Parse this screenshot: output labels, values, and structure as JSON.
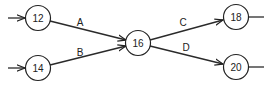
{
  "diagram": {
    "type": "activity-network",
    "colors": {
      "stroke": "#222222",
      "background": "#ffffff"
    },
    "nodes": [
      {
        "id": "12",
        "label": "12",
        "x": 38,
        "y": 18
      },
      {
        "id": "14",
        "label": "14",
        "x": 38,
        "y": 68
      },
      {
        "id": "16",
        "label": "16",
        "x": 138,
        "y": 43
      },
      {
        "id": "18",
        "label": "18",
        "x": 236,
        "y": 17
      },
      {
        "id": "20",
        "label": "20",
        "x": 236,
        "y": 67
      }
    ],
    "edges": [
      {
        "label": "A",
        "from": "12",
        "to": "16",
        "label_x": 80,
        "label_y": 22
      },
      {
        "label": "B",
        "from": "14",
        "to": "16",
        "label_x": 80,
        "label_y": 52
      },
      {
        "label": "C",
        "from": "16",
        "to": "18",
        "label_x": 183,
        "label_y": 22
      },
      {
        "label": "D",
        "from": "16",
        "to": "20",
        "label_x": 186,
        "label_y": 47
      }
    ],
    "incoming_stubs": [
      "12",
      "14"
    ],
    "outgoing_stubs": [
      "18",
      "20"
    ]
  }
}
